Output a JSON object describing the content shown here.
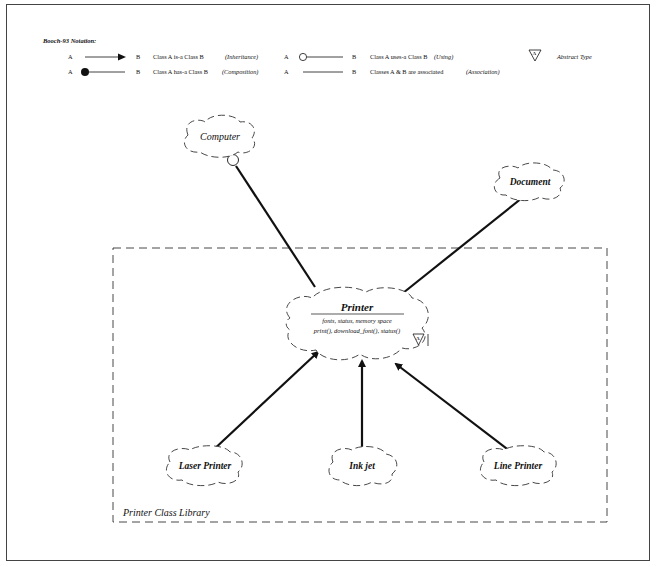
{
  "legend": {
    "title": "Booch-93 Notation:",
    "rows": [
      {
        "a": "A",
        "b": "B",
        "desc": "Class A is-a Class B",
        "kind": "(Inheritance)",
        "symbol": "arrow"
      },
      {
        "a": "A",
        "b": "B",
        "desc": "Class A has-a Class B",
        "kind": "(Composition)",
        "symbol": "filled-circle"
      },
      {
        "a": "A",
        "b": "B",
        "desc": "Class A uses-a Class B",
        "kind": "(Using)",
        "symbol": "open-circle"
      },
      {
        "a": "A",
        "b": "B",
        "desc": "Classes A & B are associated",
        "kind": "(Association)",
        "symbol": "line"
      }
    ],
    "abstract": {
      "glyph": "A",
      "label": "Abstract Type"
    }
  },
  "nodes": {
    "computer": "Computer",
    "document": "Document",
    "printer": {
      "name": "Printer",
      "attributes": "fonts, status, memory space",
      "operations": "print(), download_font(), status()",
      "abstract_glyph": "A"
    },
    "laser": "Laser Printer",
    "inkjet": "Ink jet",
    "line": "Line Printer"
  },
  "library": {
    "label": "Printer Class Library"
  },
  "colors": {
    "ink": "#111111",
    "frame": "#444444"
  }
}
